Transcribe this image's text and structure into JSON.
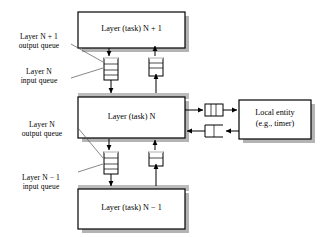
{
  "diagram": {
    "colors": {
      "stroke": "#000000",
      "shadow": "#b3b3b3",
      "background": "#ffffff",
      "queue_fill": "#ffffff"
    },
    "boxes": [
      {
        "id": "layer_n_plus_1",
        "label": "Layer (task) N + 1",
        "label_plain": "Layer (task) N + 1"
      },
      {
        "id": "layer_n",
        "label": "Layer (task) N",
        "label_plain": "Layer (task) N"
      },
      {
        "id": "layer_n_minus_1",
        "label": "Layer (task) N - 1",
        "label_plain": "Layer (task) N − 1"
      },
      {
        "id": "local_entity",
        "label_line1": "Local entity",
        "label_line2": "(e.g., timer)"
      }
    ],
    "callouts": [
      {
        "id": "layer-n-plus-1-output-queue",
        "line1": "Layer N + 1",
        "line2": "output queue"
      },
      {
        "id": "layer-n-input-queue",
        "line1": "Layer N",
        "line2": "input queue"
      },
      {
        "id": "layer-n-output-queue",
        "line1": "Layer N",
        "line2": "output queue"
      },
      {
        "id": "layer-n-minus-1-input-queue",
        "line1": "Layer N − 1",
        "line2": "input queue"
      }
    ],
    "queues": [
      {
        "id": "queue-upper-left",
        "orientation": "vertical",
        "cells": 3,
        "open_side": "bottom"
      },
      {
        "id": "queue-upper-right",
        "orientation": "vertical",
        "cells": 2,
        "open_side": "bottom"
      },
      {
        "id": "queue-lower-left",
        "orientation": "vertical",
        "cells": 3,
        "open_side": "bottom"
      },
      {
        "id": "queue-lower-right",
        "orientation": "vertical",
        "cells": 1,
        "open_side": "bottom"
      },
      {
        "id": "queue-right-out",
        "orientation": "horizontal",
        "cells": 3,
        "open_side": "none"
      },
      {
        "id": "queue-right-in",
        "orientation": "horizontal",
        "cells": 1,
        "open_side": "right"
      }
    ],
    "arrows": [
      {
        "id": "arrow-n-plus-1-down-to-queue",
        "direction": "down"
      },
      {
        "id": "arrow-queue-down-to-layer-n",
        "direction": "down"
      },
      {
        "id": "arrow-layer-n-up-to-queue",
        "direction": "up"
      },
      {
        "id": "arrow-queue-up-to-n-plus-1",
        "direction": "up"
      },
      {
        "id": "arrow-layer-n-down-to-queue",
        "direction": "down"
      },
      {
        "id": "arrow-queue-down-to-n-minus-1",
        "direction": "down"
      },
      {
        "id": "arrow-n-minus-1-up-to-queue",
        "direction": "up"
      },
      {
        "id": "arrow-queue-up-to-layer-n",
        "direction": "up"
      },
      {
        "id": "arrow-layer-n-right-to-queue",
        "direction": "right"
      },
      {
        "id": "arrow-queue-right-to-entity",
        "direction": "right"
      },
      {
        "id": "arrow-entity-left-to-queue",
        "direction": "left"
      },
      {
        "id": "arrow-queue-left-to-layer-n",
        "direction": "left"
      }
    ]
  }
}
